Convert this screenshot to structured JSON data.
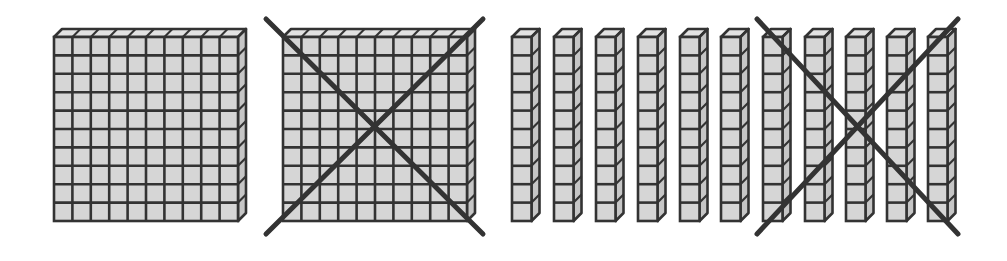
{
  "title": "Base-ten blocks: 2 hundreds flats and 11 tens rods, with one flat and five rods crossed out",
  "colors": {
    "background": "#ffffff",
    "front_fill": "#d6d6d6",
    "top_fill": "#e2e2e2",
    "side_fill": "#c6c6c6",
    "stroke": "#333333",
    "cross": "#333333"
  },
  "geometry": {
    "top_y": 37,
    "cell": 18.4,
    "rod_width": 19.5,
    "depth_x": 8,
    "depth_y": -8,
    "grid_stroke": 2.6,
    "cross_stroke": 5
  },
  "flats": [
    {
      "id": "flat-1",
      "x": 54,
      "rows": 10,
      "cols": 10,
      "crossed": false
    },
    {
      "id": "flat-2",
      "x": 283,
      "rows": 10,
      "cols": 10,
      "crossed": true
    }
  ],
  "rods": [
    {
      "id": "rod-1",
      "x": 512,
      "cubes": 10
    },
    {
      "id": "rod-2",
      "x": 554,
      "cubes": 10
    },
    {
      "id": "rod-3",
      "x": 596,
      "cubes": 10
    },
    {
      "id": "rod-4",
      "x": 638,
      "cubes": 10
    },
    {
      "id": "rod-5",
      "x": 680,
      "cubes": 10
    },
    {
      "id": "rod-6",
      "x": 721,
      "cubes": 10
    },
    {
      "id": "rod-7",
      "x": 763,
      "cubes": 10
    },
    {
      "id": "rod-8",
      "x": 805,
      "cubes": 10
    },
    {
      "id": "rod-9",
      "x": 846,
      "cubes": 10
    },
    {
      "id": "rod-10",
      "x": 887,
      "cubes": 10
    },
    {
      "id": "rod-11",
      "x": 928,
      "cubes": 10
    }
  ],
  "crosses": [
    {
      "id": "cross-flat",
      "covers": "flat-2",
      "x1": 266,
      "y1": 19,
      "x2": 483,
      "y2": 234
    },
    {
      "id": "cross-rods",
      "covers": "rods 7-11",
      "x1": 757,
      "y1": 19,
      "x2": 958,
      "y2": 234
    }
  ],
  "summary": {
    "hundreds_shown": 2,
    "tens_shown": 11,
    "hundreds_crossed": 1,
    "tens_crossed": 5
  }
}
